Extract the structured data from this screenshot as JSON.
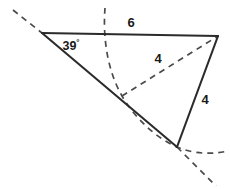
{
  "figure": {
    "background_color": "#ffffff",
    "solid_line_color": "#2b2b2b",
    "dashed_line_color": "#4a4a4a",
    "label_color": "#1a1a1a",
    "labels": {
      "angle": "39",
      "degree_symbol": "°",
      "top_side": "6",
      "middle_segment": "4",
      "right_side": "4"
    },
    "vertices": {
      "left_vertex": {
        "x": 42,
        "y": 33
      },
      "right_vertex": {
        "x": 218,
        "y": 36
      },
      "middle_intersection": {
        "x": 122,
        "y": 96
      },
      "bottom_vertex": {
        "x": 177,
        "y": 147
      }
    },
    "label_positions": {
      "angle": {
        "x": 72,
        "y": 47
      },
      "top_side": {
        "x": 131,
        "y": 25
      },
      "middle_segment": {
        "x": 158,
        "y": 60
      },
      "right_side": {
        "x": 205,
        "y": 101
      }
    },
    "segments": [
      {
        "name": "top-side-solid",
        "style": "solid",
        "from": [
          42,
          33
        ],
        "to": [
          218,
          36
        ],
        "measure": "6"
      },
      {
        "name": "left-ray-solid",
        "style": "solid",
        "from": [
          42,
          33
        ],
        "to": [
          177,
          147
        ]
      },
      {
        "name": "right-side-solid",
        "style": "solid",
        "from": [
          218,
          36
        ],
        "to": [
          177,
          147
        ],
        "measure": "4"
      },
      {
        "name": "middle-chord-dashed",
        "style": "dashed",
        "from": [
          122,
          96
        ],
        "to": [
          218,
          36
        ],
        "measure": "4"
      },
      {
        "name": "upper-left-ray-dashed",
        "style": "dashed",
        "from": [
          13,
          10
        ],
        "to": [
          42,
          33
        ]
      },
      {
        "name": "lower-right-ray-dashed",
        "style": "dashed",
        "from": [
          177,
          147
        ],
        "to": [
          215,
          185
        ]
      }
    ],
    "arcs": [
      {
        "name": "construction-arc-radius-4",
        "style": "dashed",
        "description": "arc of radius 4 centered at right vertex sweeping from top through middle intersection down to bottom vertex and beyond"
      }
    ]
  }
}
